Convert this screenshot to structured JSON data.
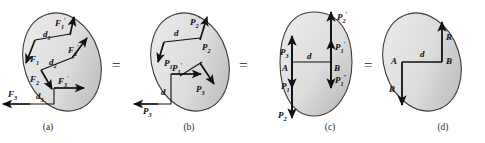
{
  "figure": {
    "background": "#ffffff",
    "blob_fill_light": "#e9e9e9",
    "blob_fill_dark": "#b9b9b9",
    "blob_stroke": "#3a3a3a",
    "arrow_color": "#111111",
    "equals_sign": "="
  },
  "equals": [
    {
      "name": "equals-a-b",
      "symbol": "="
    },
    {
      "name": "equals-b-c",
      "symbol": "="
    },
    {
      "name": "equals-c-d",
      "symbol": "="
    }
  ],
  "panels": [
    {
      "id": "a",
      "caption": "(a)",
      "labels": [
        {
          "name": "label-F1-prime",
          "base": "F",
          "sub": "1",
          "sup": "′"
        },
        {
          "name": "label-d1",
          "base": "d",
          "sub": "1",
          "sup": ""
        },
        {
          "name": "label-F2-prime",
          "base": "F",
          "sub": "2",
          "sup": "′"
        },
        {
          "name": "label-F1",
          "base": "F",
          "sub": "1",
          "sup": ""
        },
        {
          "name": "label-d2",
          "base": "d",
          "sub": "2",
          "sup": ""
        },
        {
          "name": "label-F2",
          "base": "F",
          "sub": "2",
          "sup": ""
        },
        {
          "name": "label-F3-prime",
          "base": "F",
          "sub": "3",
          "sup": "′"
        },
        {
          "name": "label-F3",
          "base": "F",
          "sub": "3",
          "sup": ""
        },
        {
          "name": "label-d3",
          "base": "d",
          "sub": "3",
          "sup": ""
        }
      ]
    },
    {
      "id": "b",
      "caption": "(b)",
      "labels": [
        {
          "name": "label-P2-prime",
          "base": "P",
          "sub": "2",
          "sup": "′"
        },
        {
          "name": "label-d-top",
          "base": "d",
          "sub": "",
          "sup": ""
        },
        {
          "name": "label-P2",
          "base": "P",
          "sub": "2",
          "sup": ""
        },
        {
          "name": "label-P1",
          "base": "P",
          "sub": "1",
          "sup": ""
        },
        {
          "name": "label-P1-prime",
          "base": "P",
          "sub": "1",
          "sup": "′"
        },
        {
          "name": "label-P3-inner",
          "base": "P",
          "sub": "3",
          "sup": ""
        },
        {
          "name": "label-d-left",
          "base": "d",
          "sub": "",
          "sup": ""
        },
        {
          "name": "label-P3",
          "base": "P",
          "sub": "3",
          "sup": ""
        }
      ]
    },
    {
      "id": "c",
      "caption": "(c)",
      "labels": [
        {
          "name": "label-P2-prime",
          "base": "P",
          "sub": "2",
          "sup": "′"
        },
        {
          "name": "label-P3",
          "base": "P",
          "sub": "3",
          "sup": ""
        },
        {
          "name": "label-point-A",
          "base": "A",
          "sub": "",
          "sup": ""
        },
        {
          "name": "label-d",
          "base": "d",
          "sub": "",
          "sup": ""
        },
        {
          "name": "label-point-B",
          "base": "B",
          "sub": "",
          "sup": ""
        },
        {
          "name": "label-P1-prime",
          "base": "P",
          "sub": "1",
          "sup": "′"
        },
        {
          "name": "label-P1-dprime",
          "base": "P",
          "sub": "1",
          "sup": "″"
        },
        {
          "name": "label-P1",
          "base": "P",
          "sub": "1",
          "sup": ""
        },
        {
          "name": "label-P2",
          "base": "P",
          "sub": "2",
          "sup": ""
        }
      ]
    },
    {
      "id": "d",
      "caption": "(d)",
      "labels": [
        {
          "name": "label-R-top",
          "base": "R",
          "sub": "",
          "sup": ""
        },
        {
          "name": "label-d",
          "base": "d",
          "sub": "",
          "sup": ""
        },
        {
          "name": "label-point-A",
          "base": "A",
          "sub": "",
          "sup": ""
        },
        {
          "name": "label-point-B",
          "base": "B",
          "sub": "",
          "sup": ""
        },
        {
          "name": "label-R-bottom",
          "base": "R",
          "sub": "",
          "sup": ""
        }
      ]
    }
  ]
}
